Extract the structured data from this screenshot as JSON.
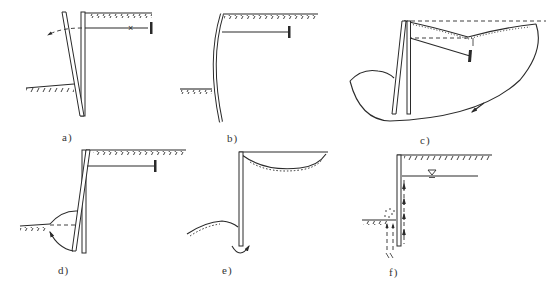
{
  "figure": {
    "type": "multi-panel engineering diagram",
    "panels": [
      {
        "id": "a",
        "label": "a)",
        "depicts": "anchored wall rotating/kicking out at toe after anchor failure (X on tie rod)"
      },
      {
        "id": "b",
        "label": "b)",
        "depicts": "excessive bending deflection of anchored wall"
      },
      {
        "id": "c",
        "label": "c)",
        "depicts": "overall deep-seated slip surface failure passing beneath wall and anchor"
      },
      {
        "id": "d",
        "label": "d)",
        "depicts": "passive-side soil heave / toe kick-out with passive wedge"
      },
      {
        "id": "e",
        "label": "e)",
        "depicts": "basal heave with retained ground settlement at cantilever wall"
      },
      {
        "id": "f",
        "label": "f)",
        "depicts": "seepage / piping failure with water table behind wall"
      }
    ],
    "caption": ""
  },
  "colors": {
    "ink": "#2a2a2a",
    "background": "#ffffff"
  }
}
